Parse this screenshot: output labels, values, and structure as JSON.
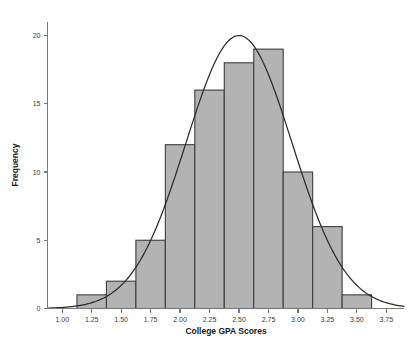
{
  "chart_data": {
    "type": "bar",
    "title": "",
    "xlabel": "College GPA Scores",
    "ylabel": "Frequency",
    "xlim": [
      0.875,
      3.9
    ],
    "ylim": [
      0,
      21
    ],
    "grid": false,
    "legend": null,
    "bin_width": 0.25,
    "bin_edges": [
      1.125,
      1.375,
      1.625,
      1.875,
      2.125,
      2.375,
      2.625,
      2.875,
      3.125,
      3.375,
      3.625
    ],
    "categories": [
      "1.125-1.375",
      "1.375-1.625",
      "1.625-1.875",
      "1.875-2.125",
      "2.125-2.375",
      "2.375-2.625",
      "2.625-2.875",
      "2.875-3.125",
      "3.125-3.375",
      "3.375-3.625"
    ],
    "bin_centers": [
      1.25,
      1.5,
      1.75,
      2.0,
      2.25,
      2.5,
      2.75,
      3.0,
      3.25,
      3.5
    ],
    "values": [
      1,
      2,
      5,
      12,
      16,
      18,
      19,
      10,
      6,
      1
    ],
    "total_count": 90,
    "xticks": [
      "1.00",
      "1.25",
      "1.50",
      "1.75",
      "2.00",
      "2.25",
      "2.50",
      "2.75",
      "3.00",
      "3.25",
      "3.50",
      "3.75"
    ],
    "xtick_values": [
      1.0,
      1.25,
      1.5,
      1.75,
      2.0,
      2.25,
      2.5,
      2.75,
      3.0,
      3.25,
      3.5,
      3.75
    ],
    "yticks": [
      "0",
      "5",
      "10",
      "15",
      "20"
    ],
    "ytick_values": [
      0,
      5,
      10,
      15,
      20
    ],
    "overlay": {
      "type": "normal-curve",
      "peak_value": 20,
      "peak_x": 2.5,
      "mean": 2.5,
      "std_dev": 0.45
    },
    "colors": {
      "bar_fill": "#b3b3b3",
      "bar_edge": "#3d3d3d",
      "curve": "#2b2b2b",
      "axis": "#7a7a7a",
      "text": "#1a1a1a",
      "background": "#ffffff"
    }
  }
}
